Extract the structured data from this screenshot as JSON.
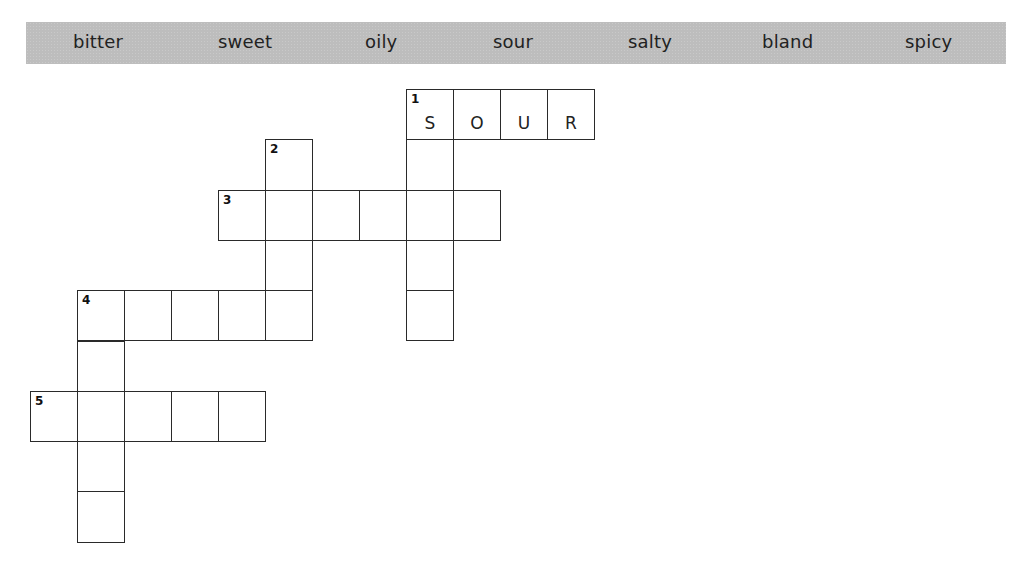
{
  "word_bank": {
    "words": [
      {
        "text": "bitter",
        "x": 73
      },
      {
        "text": "sweet",
        "x": 218
      },
      {
        "text": "oily",
        "x": 365
      },
      {
        "text": "sour",
        "x": 493
      },
      {
        "text": "salty",
        "x": 628
      },
      {
        "text": "bland",
        "x": 762
      },
      {
        "text": "spicy",
        "x": 905
      }
    ]
  },
  "grid": {
    "origin_x": 30,
    "origin_y": 89,
    "cell_w": 47,
    "cell_h": 50.3,
    "cells": [
      {
        "c": 8,
        "r": 0,
        "num": "1",
        "letter": "S"
      },
      {
        "c": 9,
        "r": 0,
        "num": "",
        "letter": "O"
      },
      {
        "c": 10,
        "r": 0,
        "num": "",
        "letter": "U"
      },
      {
        "c": 11,
        "r": 0,
        "num": "",
        "letter": "R"
      },
      {
        "c": 8,
        "r": 1,
        "num": "",
        "letter": ""
      },
      {
        "c": 8,
        "r": 2,
        "num": "",
        "letter": ""
      },
      {
        "c": 8,
        "r": 3,
        "num": "",
        "letter": ""
      },
      {
        "c": 8,
        "r": 4,
        "num": "",
        "letter": ""
      },
      {
        "c": 5,
        "r": 1,
        "num": "2",
        "letter": ""
      },
      {
        "c": 5,
        "r": 2,
        "num": "",
        "letter": ""
      },
      {
        "c": 5,
        "r": 3,
        "num": "",
        "letter": ""
      },
      {
        "c": 5,
        "r": 4,
        "num": "",
        "letter": ""
      },
      {
        "c": 4,
        "r": 2,
        "num": "3",
        "letter": ""
      },
      {
        "c": 6,
        "r": 2,
        "num": "",
        "letter": ""
      },
      {
        "c": 7,
        "r": 2,
        "num": "",
        "letter": ""
      },
      {
        "c": 9,
        "r": 2,
        "num": "",
        "letter": ""
      },
      {
        "c": 1,
        "r": 4,
        "num": "4",
        "letter": ""
      },
      {
        "c": 2,
        "r": 4,
        "num": "",
        "letter": ""
      },
      {
        "c": 3,
        "r": 4,
        "num": "",
        "letter": ""
      },
      {
        "c": 4,
        "r": 4,
        "num": "",
        "letter": ""
      },
      {
        "c": 1,
        "r": 5,
        "num": "",
        "letter": ""
      },
      {
        "c": 1,
        "r": 6,
        "num": "",
        "letter": ""
      },
      {
        "c": 1,
        "r": 7,
        "num": "",
        "letter": ""
      },
      {
        "c": 1,
        "r": 8,
        "num": "",
        "letter": ""
      },
      {
        "c": 0,
        "r": 6,
        "num": "5",
        "letter": ""
      },
      {
        "c": 2,
        "r": 6,
        "num": "",
        "letter": ""
      },
      {
        "c": 3,
        "r": 6,
        "num": "",
        "letter": ""
      },
      {
        "c": 4,
        "r": 6,
        "num": "",
        "letter": ""
      }
    ]
  },
  "clues": {
    "1_across": {
      "number": "1",
      "direction": "across",
      "length": 4,
      "answer_shown": "SOUR"
    },
    "1_down": {
      "number": "1",
      "direction": "down",
      "length": 5
    },
    "2_down": {
      "number": "2",
      "direction": "down",
      "length": 4
    },
    "3_across": {
      "number": "3",
      "direction": "across",
      "length": 6
    },
    "4_across": {
      "number": "4",
      "direction": "across",
      "length": 4
    },
    "4_down": {
      "number": "4",
      "direction": "down",
      "length": 5
    },
    "5_across": {
      "number": "5",
      "direction": "across",
      "length": 5
    }
  }
}
